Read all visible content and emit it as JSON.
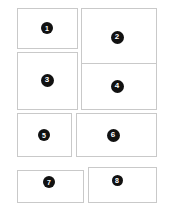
{
  "diagram": {
    "type": "panel-grid",
    "canvas": {
      "width": 173,
      "height": 211
    },
    "colors": {
      "background": "#ffffff",
      "panel_fill": "#ffffff",
      "panel_border": "#c9c9c9",
      "badge_fill": "#111111",
      "badge_text": "#ffffff"
    },
    "panels": [
      {
        "label": "1",
        "x": 17,
        "y": 8,
        "w": 61,
        "h": 41,
        "badge_cx": 47,
        "badge_cy": 28,
        "badge_d": 12
      },
      {
        "label": "2",
        "x": 81,
        "y": 8,
        "w": 76,
        "h": 57,
        "badge_cx": 117,
        "badge_cy": 37,
        "badge_d": 13
      },
      {
        "label": "3",
        "x": 17,
        "y": 52,
        "w": 61,
        "h": 58,
        "badge_cx": 47,
        "badge_cy": 80,
        "badge_d": 13
      },
      {
        "label": "4",
        "x": 81,
        "y": 63,
        "w": 76,
        "h": 47,
        "badge_cx": 117,
        "badge_cy": 86,
        "badge_d": 13
      },
      {
        "label": "5",
        "x": 17,
        "y": 113,
        "w": 55,
        "h": 44,
        "badge_cx": 44,
        "badge_cy": 135,
        "badge_d": 12
      },
      {
        "label": "6",
        "x": 76,
        "y": 113,
        "w": 81,
        "h": 44,
        "badge_cx": 113,
        "badge_cy": 135,
        "badge_d": 13
      },
      {
        "label": "7",
        "x": 17,
        "y": 170,
        "w": 67,
        "h": 33,
        "badge_cx": 49,
        "badge_cy": 182,
        "badge_d": 12
      },
      {
        "label": "8",
        "x": 88,
        "y": 167,
        "w": 69,
        "h": 36,
        "badge_cx": 117,
        "badge_cy": 180,
        "badge_d": 11
      }
    ]
  }
}
